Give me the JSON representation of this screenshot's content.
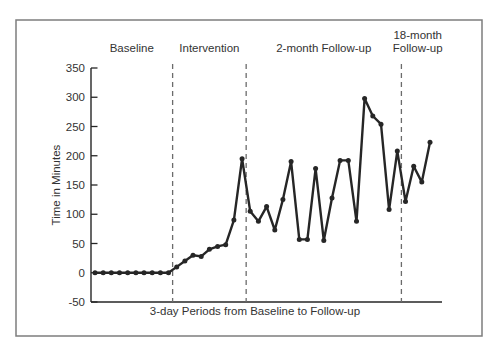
{
  "figure": {
    "background": "#ffffff",
    "border_color": "#7d7d7d",
    "line_color": "#262626",
    "dashed_line_color": "#6b6b6b",
    "text_color": "#333333"
  },
  "chart_data": {
    "type": "line",
    "title": "",
    "xlabel": "3-day Periods from Baseline to Follow-up",
    "ylabel": "Time in Minutes",
    "ylim": [
      -50,
      350
    ],
    "yticks": [
      350,
      300,
      250,
      200,
      150,
      100,
      50,
      0,
      -50
    ],
    "grid": false,
    "legend": "none",
    "marker": "filled-circle",
    "phase_divider_style": "vertical-dashed",
    "phases": [
      {
        "label": "Baseline",
        "label_lines": [
          "Baseline"
        ],
        "values": [
          0,
          0,
          0,
          0,
          0,
          0,
          0,
          0,
          0,
          0
        ]
      },
      {
        "label": "Intervention",
        "label_lines": [
          "Intervention"
        ],
        "values": [
          10,
          20,
          30,
          28,
          40,
          45,
          48,
          90,
          195
        ]
      },
      {
        "label": "2-month Follow-up",
        "label_lines": [
          "2-month Follow-up"
        ],
        "values": [
          105,
          88,
          113,
          73,
          125,
          190,
          57,
          57,
          178,
          55,
          128,
          192,
          192,
          88,
          298,
          268,
          254,
          108,
          208
        ]
      },
      {
        "label": "18-month Follow-up",
        "label_lines": [
          "18-month",
          "Follow-up"
        ],
        "values": [
          122,
          182,
          155,
          223
        ]
      }
    ]
  }
}
